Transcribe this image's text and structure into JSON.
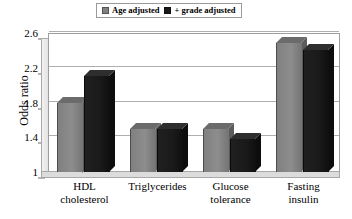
{
  "chart_data": {
    "type": "bar",
    "title": "",
    "xlabel": "",
    "ylabel": "Odds ratio",
    "ylim": [
      1,
      2.6
    ],
    "yticks": [
      "1",
      "1.4",
      "1.8",
      "2.2",
      "2.6"
    ],
    "ytick_values": [
      1,
      1.4,
      1.8,
      2.2,
      2.6
    ],
    "grid": true,
    "legend_position": "top-center",
    "style": "3d-column",
    "categories": [
      "HDL cholesterol",
      "Triglycerides",
      "Glucose tolerance",
      "Fasting insulin"
    ],
    "category_lines": [
      [
        "HDL",
        "cholesterol"
      ],
      [
        "Triglycerides",
        ""
      ],
      [
        "Glucose",
        "tolerance"
      ],
      [
        "Fasting",
        "insulin"
      ]
    ],
    "series": [
      {
        "name": "Age adjusted",
        "color": "#808080",
        "values": [
          1.8,
          1.5,
          1.5,
          2.48
        ]
      },
      {
        "name": "+ grade adjusted",
        "color": "#1a1a1a",
        "values": [
          2.1,
          1.5,
          1.38,
          2.4
        ]
      }
    ]
  },
  "legend": {
    "entries": [
      {
        "label": "Age adjusted",
        "swatch": "legend-swatch-gray",
        "color": "#808080"
      },
      {
        "label": "+ grade adjusted",
        "swatch": "legend-swatch-black",
        "color": "#1a1a1a"
      }
    ]
  },
  "axis": {
    "y_title": "Odds ratio"
  },
  "colors": {
    "series_1": "#808080",
    "series_1_top": "#6b6b6b",
    "series_1_side": "#5c5c5c",
    "series_2": "#1a1a1a",
    "series_2_top": "#2e2e2e",
    "series_2_side": "#0d0d0d",
    "gridline": "#aeaeae",
    "frame": "#9d9d9d",
    "background": "#ffffff",
    "text": "#000000"
  }
}
